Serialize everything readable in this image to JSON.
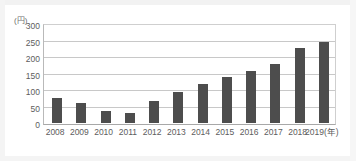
{
  "chart_data": {
    "type": "bar",
    "title": "",
    "subtitle": "",
    "xlabel": "(年)",
    "ylabel": "(円)",
    "unit_label": "(円)",
    "x_unit_suffix": "(年)",
    "categories": [
      "2008",
      "2009",
      "2010",
      "2011",
      "2012",
      "2013",
      "2014",
      "2015",
      "2016",
      "2017",
      "2018",
      "2019"
    ],
    "x_tick_labels": [
      "2008",
      "2009",
      "2010",
      "2011",
      "2012",
      "2013",
      "2014",
      "2015",
      "2016",
      "2017",
      "2018",
      "2019(年)"
    ],
    "values": [
      75,
      60,
      35,
      30,
      68,
      93,
      118,
      140,
      157,
      180,
      228,
      245
    ],
    "ylim": [
      0,
      300
    ],
    "y_ticks": [
      0,
      50,
      100,
      150,
      200,
      250,
      300
    ],
    "y_tick_labels": [
      "0",
      "50",
      "100",
      "150",
      "200",
      "250",
      "300"
    ],
    "grid": true,
    "legend": false,
    "legend_position": "none",
    "bar_color": "#4d4d4d",
    "gridline_color": "#c8c8c8",
    "axis_color": "#a8a8a8",
    "background_color": "#ffffff"
  }
}
